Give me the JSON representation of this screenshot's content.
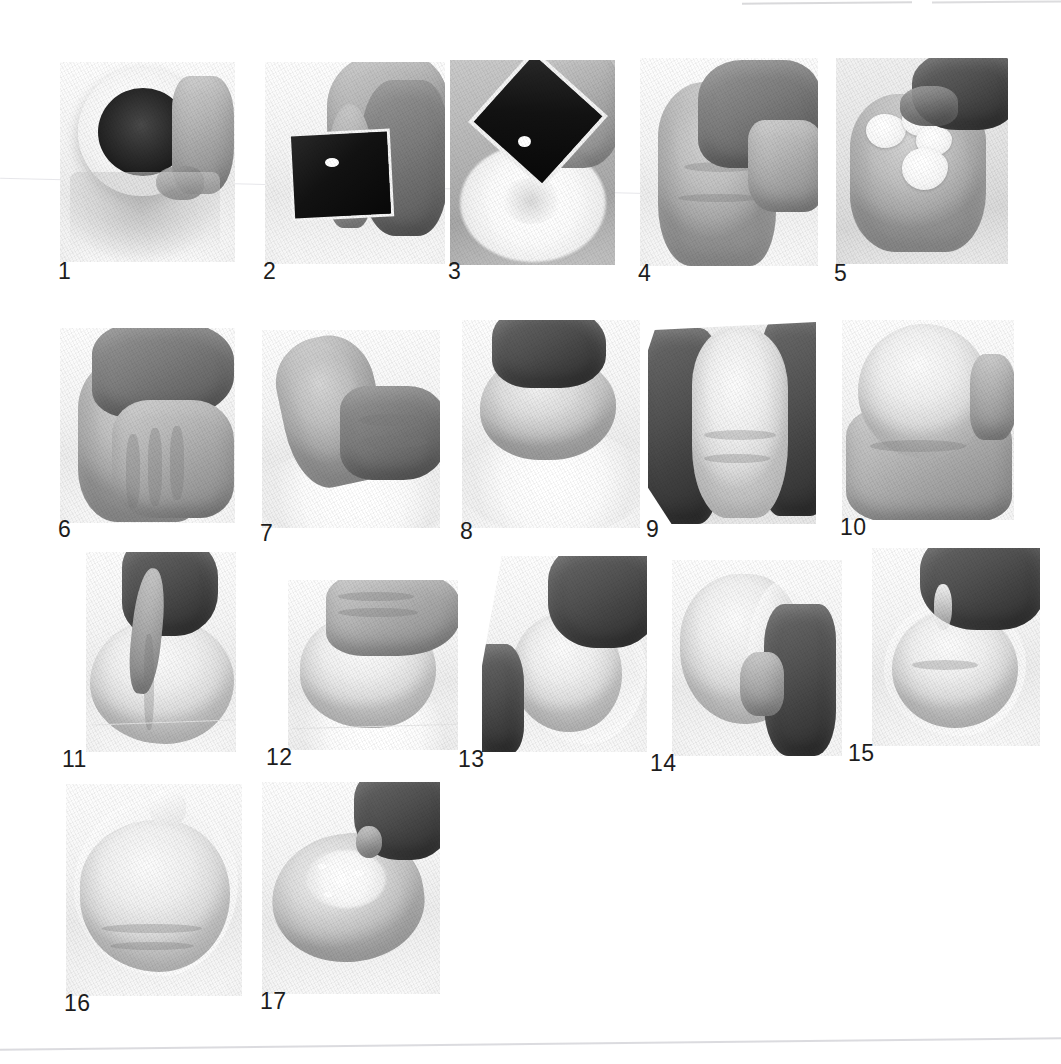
{
  "page": {
    "background_color": "#ffffff",
    "width": 1061,
    "height": 1064,
    "label_color": "#1d1d1d",
    "total_steps": 17
  },
  "artifacts": {
    "top_rule_right_a": "page-edge-mark",
    "top_rule_right_b": "page-edge-mark",
    "diagonal_hairline": "scan-fold-line",
    "bottom_rule": "page-bottom-edge"
  },
  "rows": [
    {
      "name": "row-1",
      "steps": [
        "1",
        "2",
        "3",
        "4",
        "5"
      ]
    },
    {
      "name": "row-2",
      "steps": [
        "6",
        "7",
        "8",
        "9",
        "10"
      ]
    },
    {
      "name": "row-3",
      "steps": [
        "11",
        "12",
        "13",
        "14",
        "15"
      ]
    },
    {
      "name": "row-4",
      "steps": [
        "16",
        "17"
      ]
    }
  ],
  "steps": [
    {
      "number": "1",
      "label": "1",
      "caption": "Cup of dark cocoa/filling tipped over work surface",
      "subject": "measuring-cup-with-dark-contents"
    },
    {
      "number": "2",
      "label": "2",
      "caption": "Hand holding a small dark square tray of mixture",
      "subject": "hand-holding-dark-tray"
    },
    {
      "number": "3",
      "label": "3",
      "caption": "Dark tray pouring into a well of white flour",
      "subject": "pouring-into-flour-well"
    },
    {
      "number": "4",
      "label": "4",
      "caption": "Hands kneading the rough dough mass",
      "subject": "kneading-dough"
    },
    {
      "number": "5",
      "label": "5",
      "caption": "White lard/shortening pieces added onto the dough",
      "subject": "adding-shortening"
    },
    {
      "number": "6",
      "label": "6",
      "caption": "Both hands working the fat into the dough",
      "subject": "working-fat-into-dough"
    },
    {
      "number": "7",
      "label": "7",
      "caption": "Dough stretched and folded on floured surface",
      "subject": "stretching-dough"
    },
    {
      "number": "8",
      "label": "8",
      "caption": "Dough gathered into a rounded lump",
      "subject": "gathering-dough"
    },
    {
      "number": "9",
      "label": "9",
      "caption": "Hands pressing and shaping the pale dough",
      "subject": "shaping-dough"
    },
    {
      "number": "10",
      "label": "10",
      "caption": "Smooth round ball of dough held in both hands",
      "subject": "round-dough-ball"
    },
    {
      "number": "11",
      "label": "11",
      "caption": "Fingers pinching and sealing the top of the ball",
      "subject": "pinching-dough-seam"
    },
    {
      "number": "12",
      "label": "12",
      "caption": "Palm flattening the dough ball on the counter",
      "subject": "flattening-dough"
    },
    {
      "number": "13",
      "label": "13",
      "caption": "Dough lifted onto a sheet of plastic wrap",
      "subject": "placing-on-plastic-wrap"
    },
    {
      "number": "14",
      "label": "14",
      "caption": "Plastic wrap drawn up around the dough ball",
      "subject": "wrapping-dough"
    },
    {
      "number": "15",
      "label": "15",
      "caption": "Wrap gathered and twisted at the top",
      "subject": "twisting-wrap"
    },
    {
      "number": "16",
      "label": "16",
      "caption": "Fully wrapped dough ball resting",
      "subject": "wrapped-dough-ball"
    },
    {
      "number": "17",
      "label": "17",
      "caption": "Unwrapped rested dough, dusted with flour",
      "subject": "rested-dough-dusted"
    }
  ]
}
